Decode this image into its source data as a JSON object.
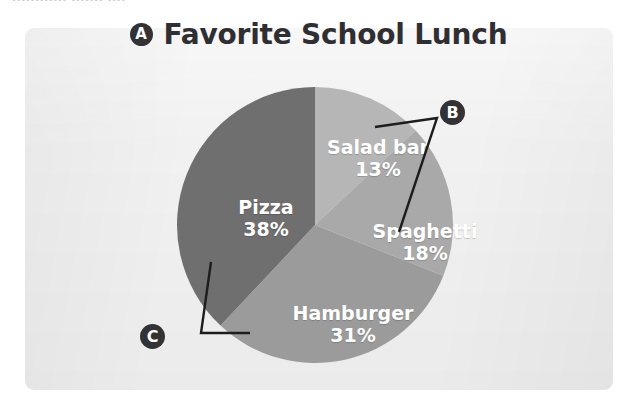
{
  "clipped_header_text": "............ ....... ....",
  "panel": {
    "background_color": "#f1f1f1"
  },
  "title": {
    "marker_label": "A",
    "text": "Favorite School Lunch"
  },
  "callouts": [
    {
      "label": "B",
      "points_to": "Spaghetti slice"
    },
    {
      "label": "C",
      "points_to": "Pizza slice"
    }
  ],
  "chart_data": {
    "type": "pie",
    "title": "Favorite School Lunch",
    "xlabel": "",
    "ylabel": "",
    "legend_position": "none",
    "labels_inside_slices": true,
    "start_angle_deg": 0,
    "direction": "clockwise",
    "categories": [
      "Salad bar",
      "Spaghetti",
      "Hamburger",
      "Pizza"
    ],
    "values": [
      13,
      18,
      31,
      38
    ],
    "value_unit": "%",
    "slices": [
      {
        "name": "Salad bar",
        "value": 13,
        "value_text": "13%",
        "color": "#b6b6b6"
      },
      {
        "name": "Spaghetti",
        "value": 18,
        "value_text": "18%",
        "color": "#a9a9a9"
      },
      {
        "name": "Hamburger",
        "value": 31,
        "value_text": "31%",
        "color": "#9b9b9b"
      },
      {
        "name": "Pizza",
        "value": 38,
        "value_text": "38%",
        "color": "#6f6f6f"
      }
    ]
  },
  "colors": {
    "marker_fill": "#333336",
    "marker_text": "#ffffff",
    "slice_label_text": "#ffffff",
    "title_text": "#2f2f33",
    "leader_line": "#1d1d1d"
  }
}
